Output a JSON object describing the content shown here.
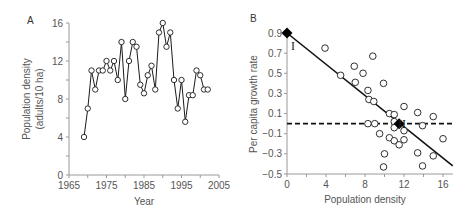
{
  "chart_data": [
    {
      "panel": "A",
      "type": "line",
      "title": "",
      "xlabel": "Year",
      "ylabel": "Population density (adults/10 ha)",
      "ylabel_lines": [
        "Population density",
        "(adults/10 ha)"
      ],
      "xlim": [
        1965,
        2005
      ],
      "ylim": [
        0,
        16
      ],
      "xticks": [
        1965,
        1975,
        1985,
        1995,
        2005
      ],
      "yticks": [
        0,
        4,
        8,
        12,
        16
      ],
      "grid": false,
      "marker": "open-circle",
      "x": [
        1969,
        1970,
        1971,
        1972,
        1973,
        1974,
        1975,
        1976,
        1977,
        1978,
        1979,
        1980,
        1981,
        1982,
        1983,
        1984,
        1985,
        1986,
        1987,
        1988,
        1989,
        1990,
        1991,
        1992,
        1993,
        1994,
        1995,
        1996,
        1997,
        1998,
        1999,
        2000,
        2001,
        2002
      ],
      "values": [
        4,
        7,
        11,
        9,
        11,
        11,
        12,
        11,
        12,
        10,
        14,
        8,
        12,
        14,
        13.5,
        9.5,
        8.6,
        10.5,
        11.5,
        9,
        15,
        16,
        13.5,
        15,
        10,
        7,
        10,
        5.6,
        8.4,
        8.4,
        11,
        10.5,
        9,
        9
      ]
    },
    {
      "panel": "B",
      "type": "scatter",
      "title": "",
      "xlabel": "Population density",
      "ylabel": "Per capita growth rate",
      "xlim": [
        0,
        17
      ],
      "ylim": [
        -0.5,
        0.9
      ],
      "xticks": [
        0,
        4,
        8,
        12,
        16
      ],
      "yticks": [
        0.9,
        0.7,
        0.5,
        0.3,
        0.1,
        -0.1,
        -0.3,
        -0.5
      ],
      "grid": false,
      "points": [
        [
          3.9,
          0.75
        ],
        [
          5.5,
          0.48
        ],
        [
          6.9,
          0.57
        ],
        [
          7.0,
          0.41
        ],
        [
          7.8,
          0.5
        ],
        [
          8.8,
          0.67
        ],
        [
          8.3,
          0.33
        ],
        [
          8.4,
          0.24
        ],
        [
          8.9,
          0.22
        ],
        [
          9.9,
          0.4
        ],
        [
          8.3,
          0.0
        ],
        [
          9.0,
          0.0
        ],
        [
          10.5,
          0.1
        ],
        [
          11.0,
          0.09
        ],
        [
          11.0,
          0.02
        ],
        [
          11.0,
          -0.04
        ],
        [
          12.0,
          0.17
        ],
        [
          13.4,
          0.11
        ],
        [
          15.0,
          0.07
        ],
        [
          9.5,
          -0.1
        ],
        [
          10.5,
          -0.14
        ],
        [
          11.0,
          -0.17
        ],
        [
          11.5,
          -0.21
        ],
        [
          12.0,
          -0.07
        ],
        [
          12.0,
          -0.16
        ],
        [
          13.9,
          -0.02
        ],
        [
          16.0,
          -0.15
        ],
        [
          10.0,
          -0.3
        ],
        [
          9.9,
          -0.43
        ],
        [
          13.4,
          -0.29
        ],
        [
          13.9,
          -0.42
        ],
        [
          15.0,
          -0.32
        ]
      ],
      "regression_line": {
        "x": [
          0,
          17
        ],
        "y": [
          0.9,
          -0.42
        ],
        "style": "solid"
      },
      "equilibrium_line": {
        "y": 0.0,
        "style": "dashed"
      },
      "annotations": [
        {
          "label": "I",
          "x": 0,
          "y": 0.9,
          "marker": "filled-diamond"
        },
        {
          "label": "II",
          "x": 11.5,
          "y": 0.0,
          "marker": "filled-diamond"
        }
      ]
    }
  ],
  "panels": {
    "a": {
      "label": "A",
      "xlabel": "Year",
      "ylabel_line1": "Population density",
      "ylabel_line2": "(adults/10 ha)"
    },
    "b": {
      "label": "B",
      "xlabel": "Population density",
      "ylabel": "Per capita growth rate",
      "point_I": "I",
      "point_II": "II"
    }
  },
  "colors": {
    "axis": "#9a9a9a",
    "line": "#1a1a1a",
    "marker_fill": "#ffffff",
    "marker_stroke": "#1a1a1a",
    "text": "#555555"
  }
}
